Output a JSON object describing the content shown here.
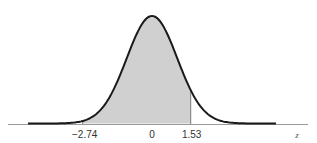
{
  "chart_data": {
    "type": "area",
    "title": "",
    "xlabel": "z",
    "ylabel": "",
    "distribution": {
      "name": "standard normal",
      "mean": 0,
      "sd": 1
    },
    "shaded_region": {
      "from": -2.74,
      "to": 1.53
    },
    "tick_labels": [
      "-2.74",
      "0",
      "1.53"
    ],
    "tick_values": [
      -2.74,
      0,
      1.53
    ],
    "xlim": [
      -4.9,
      4.9
    ],
    "grid": false,
    "legend": null,
    "colors": {
      "curve": "#1a1a1a",
      "shade": "#d0d0d0",
      "axis": "#9a9a9a",
      "boundary": "#7a7a7a"
    }
  },
  "labels": {
    "tick_neg": "−2.74",
    "tick_zero": "0",
    "tick_pos": "1.53",
    "axis_var": "z"
  }
}
